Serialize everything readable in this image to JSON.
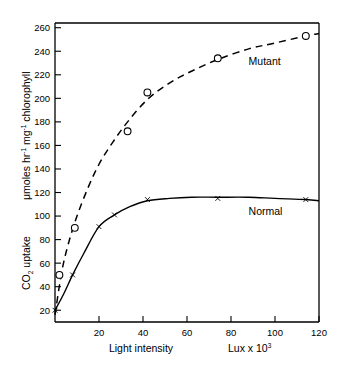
{
  "chart_data": {
    "type": "line",
    "title": "",
    "xlabel": "Light intensity    Lux x 10³",
    "xlabel_main": "Light intensity",
    "xlabel_units": "Lux x 10",
    "xlabel_units_exp": "3",
    "ylabel_top": "μmoles hr",
    "ylabel_exp1": "-1",
    "ylabel_mid": " mg",
    "ylabel_exp2": "-1",
    "ylabel_tail": " chlorophyll",
    "ylabel_bottom_pre": "CO",
    "ylabel_bottom_sub": "2",
    "ylabel_bottom_post": " uptake",
    "xlim": [
      0,
      120
    ],
    "ylim": [
      10,
      264
    ],
    "xticks": [
      20,
      40,
      60,
      80,
      100,
      120
    ],
    "yticks": [
      20,
      40,
      60,
      80,
      100,
      120,
      140,
      160,
      180,
      200,
      220,
      240,
      260
    ],
    "grid": false,
    "legend_position": "inline-annotation",
    "series": [
      {
        "name": "Mutant",
        "style": "dashed",
        "marker": "open-circle",
        "label_x": 88,
        "label_y": 228,
        "x": [
          2,
          9,
          33,
          42,
          74,
          114
        ],
        "y": [
          50,
          90,
          172,
          205,
          234,
          253
        ],
        "curve_x": [
          0,
          3,
          6,
          10,
          15,
          20,
          26,
          33,
          42,
          52,
          62,
          74,
          88,
          100,
          114,
          120
        ],
        "curve_y": [
          16,
          52,
          76,
          100,
          124,
          144,
          162,
          180,
          199,
          213,
          223,
          233,
          242,
          247,
          253,
          255
        ]
      },
      {
        "name": "Normal",
        "style": "solid",
        "marker": "tick-cross",
        "label_x": 88,
        "label_y": 101,
        "x": [
          0,
          8,
          20,
          27,
          42,
          74,
          114
        ],
        "y": [
          20,
          50,
          91,
          101,
          114,
          115,
          114
        ],
        "curve_x": [
          0,
          4,
          8,
          13,
          20,
          27,
          34,
          42,
          52,
          62,
          74,
          88,
          100,
          114,
          120
        ],
        "curve_y": [
          20,
          34,
          50,
          68,
          91,
          101,
          108,
          113,
          115,
          116,
          116,
          116,
          115,
          114,
          113
        ]
      }
    ]
  }
}
